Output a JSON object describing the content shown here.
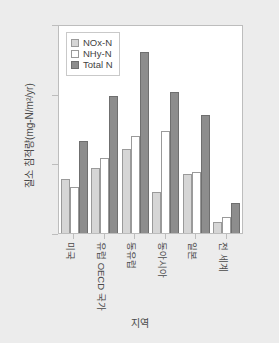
{
  "chart_data": {
    "type": "bar",
    "title": "",
    "xlabel": "지역",
    "ylabel": "질소 침적량(mg-N/m²/yr)",
    "ylim": [
      0,
      1500
    ],
    "yticks": [
      0,
      500,
      1000,
      1500
    ],
    "ytick_labels": [
      "0",
      "500",
      "1000",
      "1500"
    ],
    "grid": false,
    "legend_position": "upper left inside axes",
    "categories": [
      "미국",
      "유럽 OECD 국가",
      "동유럽",
      "동아시아",
      "일본",
      "전 세계"
    ],
    "series": [
      {
        "name": "NOx-N",
        "color": "#d6d6d6",
        "values": [
          390,
          470,
          610,
          295,
          425,
          80
        ]
      },
      {
        "name": "NHy-N",
        "color": "#ffffff",
        "values": [
          330,
          540,
          700,
          740,
          440,
          115
        ]
      },
      {
        "name": "Total N",
        "color": "#8d8d8d",
        "values": [
          670,
          995,
          1310,
          1025,
          855,
          215
        ]
      }
    ]
  },
  "legend": {
    "items": [
      {
        "label": "NOx-N"
      },
      {
        "label": "NHy-N"
      },
      {
        "label": "Total N"
      }
    ]
  },
  "colors": {
    "nox": "#d6d6d6",
    "nhy": "#ffffff",
    "total": "#8d8d8d",
    "axis": "#bdbdbd",
    "text": "#4a4a4a",
    "page_background": "#ececec",
    "plot_background": "#ffffff"
  }
}
